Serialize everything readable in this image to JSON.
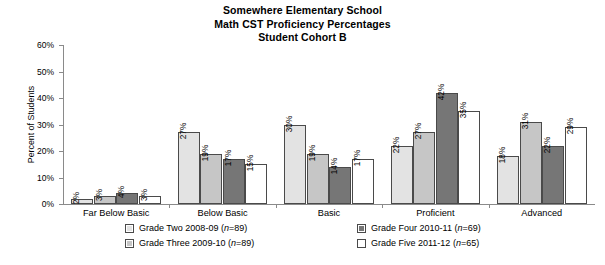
{
  "title": {
    "line1": "Somewhere Elementary School",
    "line2": "Math CST Proficiency Percentages",
    "line3": "Student Cohort B"
  },
  "axes": {
    "ylabel": "Percent of Students",
    "yticks": [
      "0%",
      "10%",
      "20%",
      "30%",
      "40%",
      "50%",
      "60%"
    ]
  },
  "legend": {
    "items": [
      {
        "label": "Grade Two 2008-09 (n=89)",
        "color": "#e3e3e3"
      },
      {
        "label": "Grade Three 2009-10 (n=89)",
        "color": "#c6c6c6"
      },
      {
        "label": "Grade Four 2010-11 (n=69)",
        "color": "#767676"
      },
      {
        "label": "Grade Five 2011-12 (n=65)",
        "color": "#ffffff"
      }
    ]
  },
  "chart_data": {
    "type": "bar",
    "title": "Somewhere Elementary School Math CST Proficiency Percentages Student Cohort B",
    "xlabel": "",
    "ylabel": "Percent of Students",
    "ylim": [
      0,
      60
    ],
    "ytick_step": 10,
    "grid": false,
    "legend_position": "bottom",
    "value_suffix": "%",
    "categories": [
      "Far Below Basic",
      "Below Basic",
      "Basic",
      "Proficient",
      "Advanced"
    ],
    "series": [
      {
        "name": "Grade Two 2008-09 (n=89)",
        "color": "#e3e3e3",
        "values": [
          2,
          27,
          30,
          22,
          18
        ],
        "labels": [
          "2%",
          "27%",
          "30%",
          "22%",
          "18%"
        ]
      },
      {
        "name": "Grade Three 2009-10 (n=89)",
        "color": "#c6c6c6",
        "values": [
          3,
          19,
          19,
          27,
          31
        ],
        "labels": [
          "3%",
          "19%",
          "19%",
          "27%",
          "31%"
        ]
      },
      {
        "name": "Grade Four 2010-11 (n=69)",
        "color": "#767676",
        "values": [
          4,
          17,
          14,
          42,
          22
        ],
        "labels": [
          "4%",
          "17%",
          "14%",
          "42%",
          "22%"
        ]
      },
      {
        "name": "Grade Five 2011-12 (n=65)",
        "color": "#ffffff",
        "values": [
          3,
          15,
          17,
          35,
          29
        ],
        "labels": [
          "3%",
          "15%",
          "17%",
          "35%",
          "29%"
        ]
      }
    ]
  }
}
